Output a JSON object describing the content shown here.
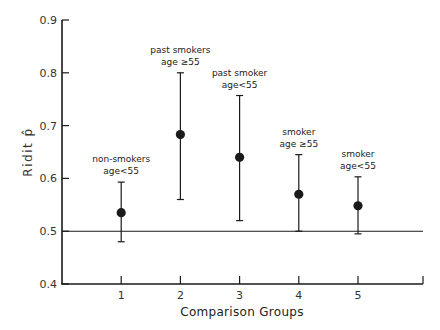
{
  "chart_data": {
    "type": "scatter",
    "subtype": "point-with-error-bars",
    "title": "",
    "xlabel": "Comparison Groups",
    "ylabel": "Ridit p̂",
    "ylim": [
      0.4,
      0.9
    ],
    "xlim": [
      0,
      6
    ],
    "yticks": [
      0.4,
      0.5,
      0.6,
      0.7,
      0.8,
      0.9
    ],
    "ytick_labels": [
      "0.4",
      "0.5",
      "0.6",
      "0.7",
      "0.8",
      "0.9"
    ],
    "xticks": [
      1,
      2,
      3,
      4,
      5
    ],
    "xtick_labels": [
      "1",
      "2",
      "3",
      "4",
      "5"
    ],
    "grid": false,
    "legend": null,
    "reference_line": {
      "y": 0.5,
      "style": "solid horizontal"
    },
    "points": [
      {
        "group": 1,
        "label_line1": "non-smokers",
        "label_line2": "age<55",
        "estimate": 0.535,
        "lower": 0.48,
        "upper": 0.593
      },
      {
        "group": 2,
        "label_line1": "past smokers",
        "label_line2": "age ≥55",
        "estimate": 0.683,
        "lower": 0.56,
        "upper": 0.8
      },
      {
        "group": 3,
        "label_line1": "past smoker",
        "label_line2": "age<55",
        "estimate": 0.64,
        "lower": 0.52,
        "upper": 0.757
      },
      {
        "group": 4,
        "label_line1": "smoker",
        "label_line2": "age ≥55",
        "estimate": 0.57,
        "lower": 0.5,
        "upper": 0.645
      },
      {
        "group": 5,
        "label_line1": "smoker",
        "label_line2": "age<55",
        "estimate": 0.548,
        "lower": 0.495,
        "upper": 0.603
      }
    ],
    "caption_fragment": "...                    . .  .  .  . . .  f. fl"
  },
  "layout": {
    "plot": {
      "x0": 62,
      "x1": 423,
      "y_top": 20,
      "y_bottom": 284,
      "x_unit_px": 59.2
    },
    "colors": {
      "ink": "#1a1a1a",
      "axis": "#222222",
      "faint": "#bbbbbb"
    }
  }
}
